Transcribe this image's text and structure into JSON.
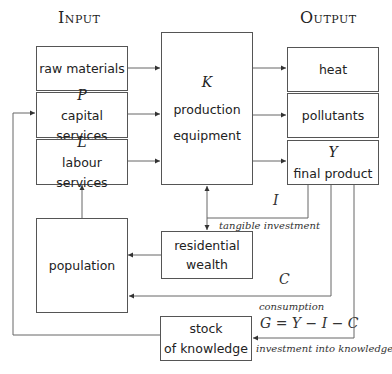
{
  "headers": {
    "input": "Input",
    "output": "Output"
  },
  "boxes": {
    "raw_materials": {
      "label": "raw materials"
    },
    "capital_services": {
      "var": "P",
      "label": "capital services"
    },
    "labour_services": {
      "var": "L",
      "label": "labour services"
    },
    "production_equipment": {
      "var": "K",
      "line1": "production",
      "line2": "equipment"
    },
    "heat": {
      "label": "heat"
    },
    "pollutants": {
      "label": "pollutants"
    },
    "final_product": {
      "var": "Y",
      "label": "final product"
    },
    "population": {
      "label": "population"
    },
    "residential_wealth": {
      "line1": "residential",
      "line2": "wealth"
    },
    "stock_of_knowledge": {
      "line1": "stock",
      "line2": "of knowledge"
    }
  },
  "flow_labels": {
    "investment_var": "I",
    "tangible_investment": "tangible investment",
    "consumption_var": "C",
    "consumption": "consumption",
    "knowledge_equation": "G = Y − I − C",
    "investment_into_knowledge": "investment into knowledge"
  },
  "colors": {
    "line": "#555555",
    "text": "#222222"
  }
}
